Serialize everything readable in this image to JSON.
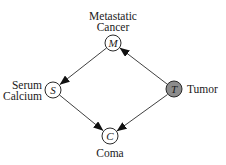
{
  "diagram": {
    "type": "bayesian-network",
    "nodes": [
      {
        "id": "M",
        "symbol": "M",
        "label_line1": "Metastatic",
        "label_line2": "Cancer",
        "shaded": false,
        "x": 113,
        "y": 43
      },
      {
        "id": "S",
        "symbol": "S",
        "label_line1": "Serum",
        "label_line2": "Calcium",
        "shaded": false,
        "x": 53,
        "y": 90
      },
      {
        "id": "T",
        "symbol": "T",
        "label_line1": "Tumor",
        "label_line2": "",
        "shaded": true,
        "x": 174,
        "y": 89
      },
      {
        "id": "C",
        "symbol": "C",
        "label_line1": "Coma",
        "label_line2": "",
        "shaded": false,
        "x": 110,
        "y": 136
      }
    ],
    "edges": [
      {
        "from": "M",
        "to": "S"
      },
      {
        "from": "T",
        "to": "M"
      },
      {
        "from": "S",
        "to": "C"
      },
      {
        "from": "T",
        "to": "C"
      }
    ],
    "colors": {
      "node_fill": "#ffffff",
      "shaded_fill": "#8c8c8c",
      "stroke": "#2a2a2a"
    }
  }
}
